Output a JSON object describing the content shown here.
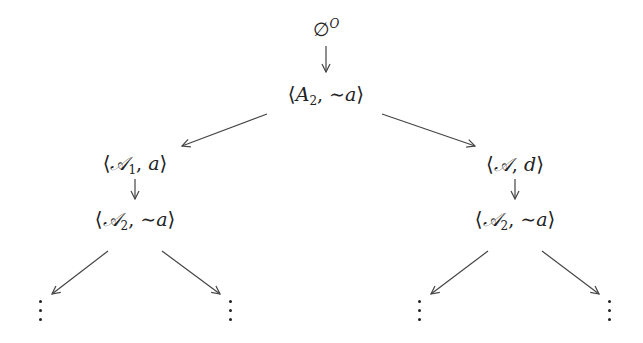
{
  "diagram": {
    "type": "tree",
    "root": {
      "id": "root",
      "label": "∅^O",
      "symbol": "∅",
      "superscript": "O"
    },
    "nodes": [
      {
        "id": "n0",
        "label": "⟨A₂, ∼a⟩",
        "argument": "A",
        "subscript": "2",
        "conclusion": "∼a",
        "calligraphic": false
      },
      {
        "id": "n1",
        "label": "⟨𝒜₁, a⟩",
        "argument": "𝒜",
        "subscript": "1",
        "conclusion": "a",
        "calligraphic": true
      },
      {
        "id": "n2",
        "label": "⟨𝒜, d⟩",
        "argument": "𝒜",
        "subscript": "",
        "conclusion": "d",
        "calligraphic": true
      },
      {
        "id": "n3",
        "label": "⟨𝒜₂, ∼a⟩",
        "argument": "𝒜",
        "subscript": "2",
        "conclusion": "∼a",
        "calligraphic": true
      },
      {
        "id": "n4",
        "label": "⟨𝒜₂, ∼a⟩",
        "argument": "𝒜",
        "subscript": "2",
        "conclusion": "∼a",
        "calligraphic": true
      }
    ],
    "edges": [
      {
        "from": "root",
        "to": "n0"
      },
      {
        "from": "n0",
        "to": "n1"
      },
      {
        "from": "n0",
        "to": "n2"
      },
      {
        "from": "n1",
        "to": "n3"
      },
      {
        "from": "n2",
        "to": "n4"
      },
      {
        "from": "n3",
        "to": "ellipsis-1"
      },
      {
        "from": "n3",
        "to": "ellipsis-2"
      },
      {
        "from": "n4",
        "to": "ellipsis-3"
      },
      {
        "from": "n4",
        "to": "ellipsis-4"
      }
    ],
    "ellipsis": "⋮",
    "colors": {
      "ink": "#222222",
      "background": "#ffffff",
      "arrow": "#444444"
    }
  }
}
